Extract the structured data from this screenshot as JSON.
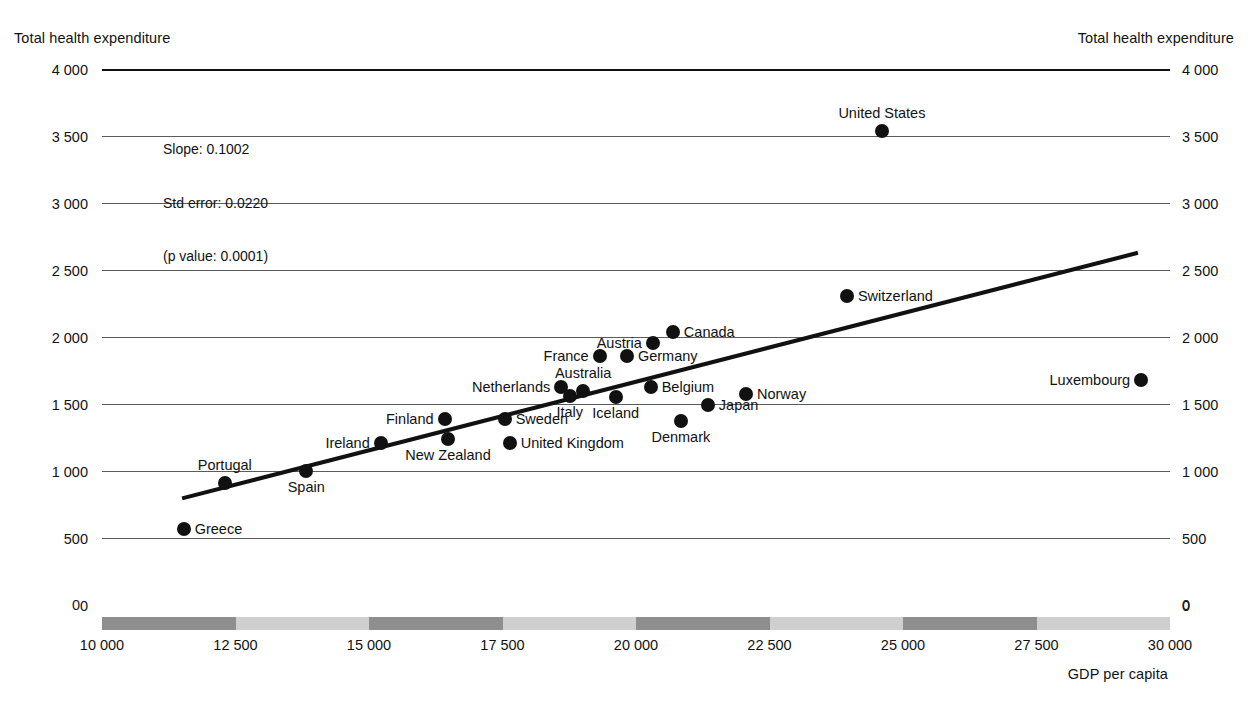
{
  "figure": {
    "y_axis_title_left": "Total health expenditure",
    "y_axis_title_right": "Total health expenditure",
    "x_axis_title": "GDP per capita"
  },
  "annotation": {
    "line1": "Slope:  0.1002",
    "line2": "Std error:  0.0220",
    "line3": "(p value:  0.0001)"
  },
  "colors": {
    "ink": "#111111",
    "gridline": "#5b5b5b",
    "band_dark": "#8e8e8e",
    "band_light": "#cfcfcf",
    "point": "#111111",
    "fit_line": "#111111"
  },
  "chart_data": {
    "type": "scatter",
    "title": "",
    "xlabel": "GDP per capita",
    "ylabel": "Total health expenditure",
    "xlim": [
      10000,
      30000
    ],
    "ylim": [
      0,
      4000
    ],
    "xticks": [
      "10 000",
      "12 500",
      "15 000",
      "17 500",
      "20 000",
      "22 500",
      "25 000",
      "27 500",
      "30 000"
    ],
    "xtick_values": [
      10000,
      12500,
      15000,
      17500,
      20000,
      22500,
      25000,
      27500,
      30000
    ],
    "yticks": [
      "0",
      "500",
      "1 000",
      "1 500",
      "2 000",
      "2 500",
      "3 000",
      "3 500",
      "4 000"
    ],
    "ytick_values": [
      0,
      500,
      1000,
      1500,
      2000,
      2500,
      3000,
      3500,
      4000
    ],
    "grid": true,
    "legend": "none",
    "fit_line": {
      "slope": 0.1002,
      "std_error": 0.022,
      "p_value": 0.0001,
      "x_start": 11500,
      "y_start": 800,
      "x_end": 29400,
      "y_end": 2635
    },
    "points": [
      {
        "name": "Greece",
        "x": 11530,
        "y": 575,
        "label_pos": "right"
      },
      {
        "name": "Portugal",
        "x": 12300,
        "y": 915,
        "label_pos": "above"
      },
      {
        "name": "Spain",
        "x": 13825,
        "y": 1005,
        "label_pos": "below"
      },
      {
        "name": "Ireland",
        "x": 15220,
        "y": 1215,
        "label_pos": "left"
      },
      {
        "name": "New Zealand",
        "x": 16480,
        "y": 1240,
        "label_pos": "below"
      },
      {
        "name": "Finland",
        "x": 16415,
        "y": 1390,
        "label_pos": "left"
      },
      {
        "name": "Sweden",
        "x": 17540,
        "y": 1390,
        "label_pos": "right"
      },
      {
        "name": "United Kingdom",
        "x": 17635,
        "y": 1215,
        "label_pos": "right"
      },
      {
        "name": "Netherlands",
        "x": 18600,
        "y": 1635,
        "label_pos": "left"
      },
      {
        "name": "Italy",
        "x": 18760,
        "y": 1565,
        "label_pos": "below"
      },
      {
        "name": "Australia",
        "x": 19010,
        "y": 1600,
        "label_pos": "above"
      },
      {
        "name": "France",
        "x": 19320,
        "y": 1860,
        "label_pos": "left"
      },
      {
        "name": "Germany",
        "x": 19830,
        "y": 1860,
        "label_pos": "right"
      },
      {
        "name": "Austria",
        "x": 20315,
        "y": 1960,
        "label_pos": "left"
      },
      {
        "name": "Canada",
        "x": 20690,
        "y": 2045,
        "label_pos": "right"
      },
      {
        "name": "Iceland",
        "x": 19620,
        "y": 1555,
        "label_pos": "below"
      },
      {
        "name": "Belgium",
        "x": 20275,
        "y": 1635,
        "label_pos": "right"
      },
      {
        "name": "Denmark",
        "x": 20840,
        "y": 1380,
        "label_pos": "below"
      },
      {
        "name": "Japan",
        "x": 21345,
        "y": 1500,
        "label_pos": "right"
      },
      {
        "name": "Norway",
        "x": 22060,
        "y": 1580,
        "label_pos": "right"
      },
      {
        "name": "Switzerland",
        "x": 23950,
        "y": 2310,
        "label_pos": "right"
      },
      {
        "name": "United States",
        "x": 24605,
        "y": 3545,
        "label_pos": "above"
      },
      {
        "name": "Luxembourg",
        "x": 29460,
        "y": 1685,
        "label_pos": "left"
      }
    ]
  }
}
